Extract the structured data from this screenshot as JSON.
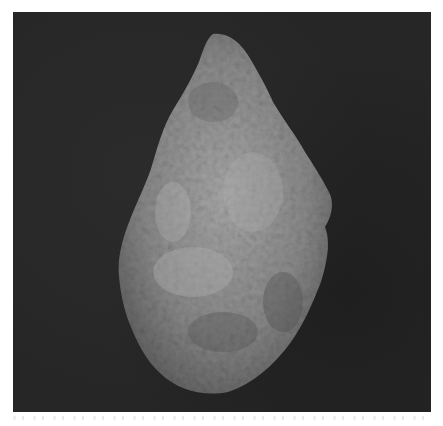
{
  "image": {
    "subject": "stone-artifact",
    "description": "Grey textured stone tool (hand-axe shaped rock) photographed on a dark background",
    "background_color": "#262626",
    "stone_base_color": "#8a8a8a",
    "stone_highlight_color": "#b8b8b8",
    "stone_shadow_color": "#555555"
  }
}
